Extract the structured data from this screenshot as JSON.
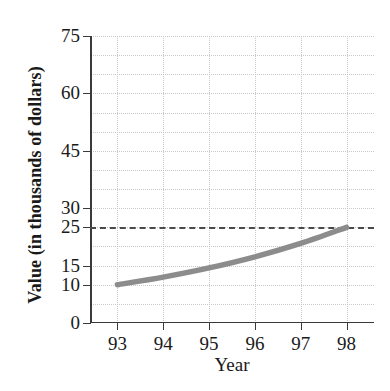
{
  "chart_data": {
    "type": "line",
    "title": "",
    "xlabel": "Year",
    "ylabel": "Value (in thousands of dollars)",
    "xlim": [
      92.4,
      98.6
    ],
    "ylim": [
      0,
      75
    ],
    "grid": true,
    "legend": null,
    "x": [
      93,
      94,
      95,
      96,
      97,
      98
    ],
    "series": [
      {
        "name": "Value",
        "color": "#8c8c8c",
        "values": [
          10,
          12.0,
          14.4,
          17.3,
          20.8,
          25
        ]
      }
    ],
    "annotations": [
      {
        "name": "reference-line",
        "type": "hline",
        "value": 25,
        "style": "dashed",
        "color": "#4a4a4a"
      }
    ],
    "y_ticks": [
      {
        "value": 0,
        "label": "0"
      },
      {
        "value": 10,
        "label": "10"
      },
      {
        "value": 15,
        "label": "15"
      },
      {
        "value": 25,
        "label": "25"
      },
      {
        "value": 30,
        "label": "30"
      },
      {
        "value": 45,
        "label": "45"
      },
      {
        "value": 60,
        "label": "60"
      },
      {
        "value": 75,
        "label": "75"
      }
    ],
    "x_ticks": [
      {
        "value": 93,
        "label": "93"
      },
      {
        "value": 94,
        "label": "94"
      },
      {
        "value": 95,
        "label": "95"
      },
      {
        "value": 96,
        "label": "96"
      },
      {
        "value": 97,
        "label": "97"
      },
      {
        "value": 98,
        "label": "98"
      }
    ],
    "y_gridlines": [
      5,
      10,
      15,
      20,
      25,
      30,
      35,
      40,
      45,
      50,
      55,
      60,
      65,
      70,
      75
    ],
    "x_gridlines": [
      93,
      94,
      95,
      96,
      97,
      98
    ],
    "colors": {
      "curve": "#8c8c8c",
      "axis": "#3a3a3a",
      "grid": "#c9c9c9",
      "reference": "#4a4a4a",
      "background": "#ffffff",
      "text": "#1a1a1a"
    }
  }
}
